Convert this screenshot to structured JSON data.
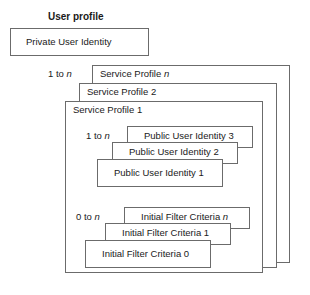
{
  "diagram": {
    "type": "nested-stacked-boxes",
    "title": "User profile",
    "private_identity": {
      "label": "Private User Identity"
    },
    "service_profiles": {
      "cardinality": "1 to n",
      "cardinality_prefix": "1 to ",
      "cardinality_suffix": "n",
      "boxes": [
        {
          "label_prefix": "Service Profile ",
          "label_suffix": "n",
          "label": "Service Profile n"
        },
        {
          "label_prefix": "Service Profile ",
          "label_suffix": "2",
          "label": "Service Profile 2"
        },
        {
          "label_prefix": "Service Profile ",
          "label_suffix": "1",
          "label": "Service Profile 1"
        }
      ]
    },
    "public_identities": {
      "cardinality": "1 to n",
      "cardinality_prefix": "1 to ",
      "cardinality_suffix": "n",
      "boxes": [
        {
          "label": "Public User Identity 3"
        },
        {
          "label": "Public User Identity 2"
        },
        {
          "label": "Public User Identity 1"
        }
      ]
    },
    "initial_filter_criteria": {
      "cardinality": "0 to n",
      "cardinality_prefix": "0 to ",
      "cardinality_suffix": "n",
      "boxes": [
        {
          "label_prefix": "Initial Filter Criteria ",
          "label_suffix": "n",
          "label": "Initial Filter Criteria n"
        },
        {
          "label_prefix": "Initial Filter Criteria ",
          "label_suffix": "1",
          "label": "Initial Filter Criteria 1"
        },
        {
          "label_prefix": "Initial Filter Criteria ",
          "label_suffix": "0",
          "label": "Initial Filter Criteria 0"
        }
      ]
    },
    "colors": {
      "stroke": "#6b6b6b",
      "fill": "#ffffff",
      "text": "#1a1a1a"
    }
  }
}
